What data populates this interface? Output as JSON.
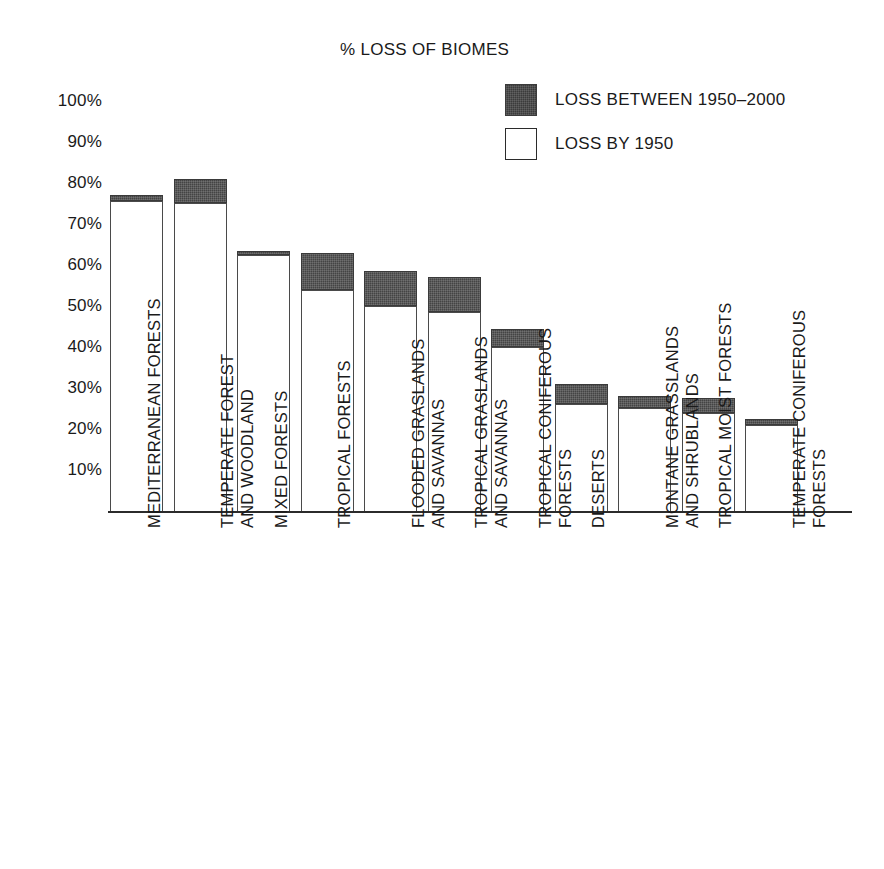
{
  "chart": {
    "title": "% LOSS OF BIOMES"
  },
  "legend": {
    "position": "top-right",
    "items": [
      {
        "label": "LOSS BETWEEN 1950–2000",
        "swatch": "dark",
        "color": "#444444"
      },
      {
        "label": "LOSS BY 1950",
        "swatch": "light",
        "color": "#ffffff"
      }
    ]
  },
  "yaxis": {
    "ticks": [
      "100%",
      "90%",
      "80%",
      "70%",
      "60%",
      "50%",
      "40%",
      "30%",
      "20%",
      "10%"
    ],
    "min": 0,
    "max": 100
  },
  "chart_data": {
    "type": "bar",
    "title": "% LOSS OF BIOMES",
    "subtitle": "",
    "xlabel": "",
    "ylabel": "",
    "ylim": [
      0,
      100
    ],
    "ytick_labels": [
      "10%",
      "20%",
      "30%",
      "40%",
      "50%",
      "60%",
      "70%",
      "80%",
      "90%",
      "100%"
    ],
    "grid": false,
    "stacked": true,
    "legend_position": "top-right",
    "categories": [
      "MEDITERRANEAN FORESTS",
      "TEMPERATE FOREST AND WOODLAND",
      "MIXED FORESTS",
      "TROPICAL FORESTS",
      "FLOODED GRASLANDS AND SAVANNAS",
      "TROPICAL GRASLANDS AND SAVANNAS",
      "TROPICAL CONIFEROUS FORESTS",
      "DESERTS",
      "MONTANE GRASSLANDS AND SHRUBLANDS",
      "TROPICAL MOIST FORESTS",
      "TEMPERATE CONIFEROUS FORESTS"
    ],
    "series": [
      {
        "name": "LOSS BY 1950",
        "color": "#ffffff",
        "values": [
          75.5,
          75,
          62.5,
          54,
          50,
          48.5,
          40,
          26,
          25,
          24,
          21
        ]
      },
      {
        "name": "LOSS BETWEEN 1950–2000",
        "color": "#444444",
        "values": [
          1.5,
          6,
          1,
          9,
          8.5,
          8.5,
          4.5,
          5,
          3,
          3.5,
          1.5
        ]
      }
    ],
    "totals": [
      77,
      81,
      63.5,
      63,
      58.5,
      57,
      44.5,
      31,
      28,
      27.5,
      22.5
    ]
  },
  "bars": [
    {
      "label_lines": [
        "MEDITERRANEAN FORESTS"
      ],
      "light": 75.5,
      "dark": 1.5,
      "total": 77
    },
    {
      "label_lines": [
        "TEMPERATE FOREST",
        "AND WOODLAND"
      ],
      "light": 75,
      "dark": 6,
      "total": 81
    },
    {
      "label_lines": [
        "MIXED FORESTS"
      ],
      "light": 62.5,
      "dark": 1,
      "total": 63.5
    },
    {
      "label_lines": [
        "TROPICAL FORESTS"
      ],
      "light": 54,
      "dark": 9,
      "total": 63
    },
    {
      "label_lines": [
        "FLOODED GRASLANDS",
        "AND SAVANNAS"
      ],
      "light": 50,
      "dark": 8.5,
      "total": 58.5
    },
    {
      "label_lines": [
        "TROPICAL GRASLANDS",
        "AND SAVANNAS"
      ],
      "light": 48.5,
      "dark": 8.5,
      "total": 57
    },
    {
      "label_lines": [
        "TROPICAL CONIFEROUS",
        "FORESTS"
      ],
      "light": 40,
      "dark": 4.5,
      "total": 44.5
    },
    {
      "label_lines": [
        "DESERTS"
      ],
      "light": 26,
      "dark": 5,
      "total": 31
    },
    {
      "label_lines": [
        "MONTANE GRASSLANDS",
        "AND SHRUBLANDS"
      ],
      "light": 25,
      "dark": 3,
      "total": 28
    },
    {
      "label_lines": [
        "TROPICAL MOIST FORESTS"
      ],
      "light": 24,
      "dark": 3.5,
      "total": 27.5
    },
    {
      "label_lines": [
        "TEMPERATE CONIFEROUS",
        "FORESTS"
      ],
      "light": 21,
      "dark": 1.5,
      "total": 22.5
    }
  ]
}
